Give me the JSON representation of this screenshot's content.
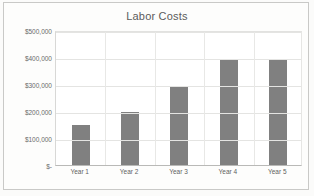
{
  "chart_data": {
    "type": "bar",
    "title": "Labor Costs",
    "xlabel": "",
    "ylabel": "",
    "categories": [
      "Year 1",
      "Year 2",
      "Year 3",
      "Year 4",
      "Year 5"
    ],
    "values": [
      148000,
      195000,
      292000,
      393000,
      390000
    ],
    "ylim": [
      0,
      500000
    ],
    "ytick_values": [
      500000,
      400000,
      300000,
      200000,
      100000,
      0
    ],
    "ytick_labels": [
      "$500,000",
      "$400,000",
      "$300,000",
      "$200,000",
      "$100,000",
      "$-"
    ],
    "grid": true,
    "legend": false,
    "series_color": "#808080"
  },
  "colors": {
    "bar": "#808080",
    "gridline": "#e4e4e2",
    "axis": "#b9b9b7",
    "title_text": "#5b5b5b",
    "tick_text": "#6a6a6a",
    "plot_background": "#ffffff",
    "page_background": "#fdfdfc",
    "frame_border": "#c9c9c7"
  }
}
